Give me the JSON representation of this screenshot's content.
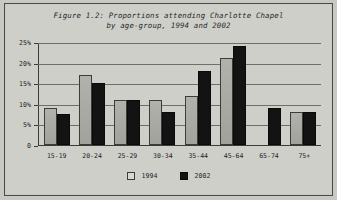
{
  "figure": {
    "title": "Figure 1.2: Proportions attending Charlotte Chapel\nby age-group, 1994 and 2002"
  },
  "legend": {
    "items": [
      {
        "label": "1994",
        "color": "#d8d8d3",
        "swatch": "legend-swatch-1994"
      },
      {
        "label": "2002",
        "color": "#131313",
        "swatch": "legend-swatch-2002"
      }
    ]
  },
  "axis": {
    "y_ticks": [
      "25%",
      "20%",
      "15%",
      "10%",
      "5%",
      "0"
    ]
  },
  "chart_data": {
    "type": "bar",
    "title": "Figure 1.2: Proportions attending Charlotte Chapel by age-group, 1994 and 2002",
    "xlabel": "",
    "ylabel": "",
    "ylim": [
      0,
      25
    ],
    "ytick_labels": [
      "0",
      "5%",
      "10%",
      "15%",
      "20%",
      "25%"
    ],
    "ytick_values": [
      0,
      5,
      10,
      15,
      20,
      25
    ],
    "grid": true,
    "legend_position": "bottom",
    "categories": [
      "15-19",
      "20-24",
      "25-29",
      "30-34",
      "35-44",
      "45-64",
      "65-74",
      "75+"
    ],
    "series": [
      {
        "name": "1994",
        "color": "#d8d8d3",
        "values": [
          9,
          17,
          11,
          11,
          12,
          21,
          0,
          8
        ]
      },
      {
        "name": "2002",
        "color": "#131313",
        "values": [
          7.5,
          15,
          11,
          8,
          18,
          24,
          9,
          8
        ]
      }
    ]
  }
}
